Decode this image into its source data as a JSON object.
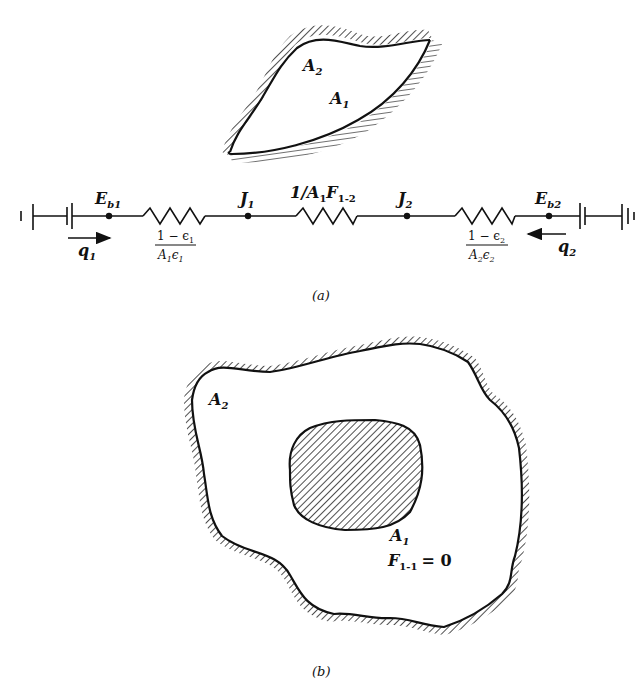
{
  "figure": {
    "panel_a": {
      "caption": "(a)",
      "enclosure": {
        "surface_outer_label": "A",
        "surface_outer_sub": "2",
        "surface_inner_label": "A",
        "surface_inner_sub": "1"
      },
      "circuit": {
        "node_left": {
          "label": "E",
          "sub": "b1"
        },
        "node_j1": {
          "label": "J",
          "sub": "1"
        },
        "node_j2": {
          "label": "J",
          "sub": "2"
        },
        "node_right": {
          "label": "E",
          "sub": "b2"
        },
        "resistor_left": {
          "numerator": "1 − ϵ",
          "num_sub": "1",
          "denominator": "A",
          "den_sub1": "1",
          "den_eps": "ϵ",
          "den_sub2": "1"
        },
        "resistor_middle": {
          "prefix": "1/A",
          "sub_a": "1",
          "f": "F",
          "sub_f": "1-2"
        },
        "resistor_right": {
          "numerator": "1 − ϵ",
          "num_sub": "2",
          "denominator": "A",
          "den_sub1": "2",
          "den_eps": "ϵ",
          "den_sub2": "2"
        },
        "flux_left": {
          "label": "q",
          "sub": "1",
          "direction": "right"
        },
        "flux_right": {
          "label": "q",
          "sub": "2",
          "direction": "left"
        }
      }
    },
    "panel_b": {
      "caption": "(b)",
      "outer_label": "A",
      "outer_sub": "2",
      "inner_label": "A",
      "inner_sub": "1",
      "view_factor_label": "F",
      "view_factor_sub": "1-1",
      "view_factor_value": "= 0"
    }
  }
}
